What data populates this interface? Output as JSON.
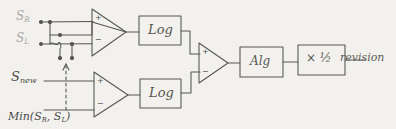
{
  "diagram": {
    "medium": "hand-drawn pencil sketch",
    "paper_color": "#f2f1ee",
    "ink_color": "#555550",
    "faint_ink_color": "#a9a8a4",
    "inputs": [
      {
        "id": "in-sr",
        "label_main": "S",
        "label_sub": "R",
        "faint": true
      },
      {
        "id": "in-sl",
        "label_main": "S",
        "label_sub": "L",
        "faint": true
      },
      {
        "id": "in-snew",
        "label_main": "S",
        "label_sub": "new",
        "faint": false
      },
      {
        "id": "in-min",
        "label_main": "Min(S",
        "label_sub": "R",
        "label_tail": ", S",
        "label_sub2": "L",
        "label_close": ")",
        "faint": false
      }
    ],
    "blocks": [
      {
        "id": "log-top",
        "label": "Log"
      },
      {
        "id": "log-bottom",
        "label": "Log"
      },
      {
        "id": "alg",
        "label": "Alg"
      },
      {
        "id": "half",
        "label": "× ½",
        "numerator": "1",
        "denominator": "2",
        "operator": "×"
      }
    ],
    "amplifiers": [
      {
        "id": "amp-top",
        "plus": "+",
        "minus": "−"
      },
      {
        "id": "amp-bottom",
        "plus": "+",
        "minus": "−"
      },
      {
        "id": "amp-diff",
        "plus": "+",
        "minus": "−"
      }
    ],
    "output": {
      "id": "out",
      "label": "revision"
    },
    "annotations": {
      "feedback_arrow": "dashed upward arrow from Min(S_R,S_L) rail to resistor node"
    }
  }
}
